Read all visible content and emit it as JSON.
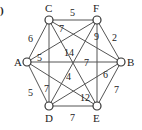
{
  "figure": {
    "corner_mark": ")",
    "nodes": [
      {
        "id": "C",
        "label": "C",
        "x": 49,
        "y": 20
      },
      {
        "id": "F",
        "label": "F",
        "x": 97,
        "y": 20
      },
      {
        "id": "A",
        "label": "A",
        "x": 27,
        "y": 62
      },
      {
        "id": "B",
        "label": "B",
        "x": 121,
        "y": 62
      },
      {
        "id": "D",
        "label": "D",
        "x": 49,
        "y": 106
      },
      {
        "id": "E",
        "label": "E",
        "x": 97,
        "y": 106
      }
    ],
    "edges": [
      {
        "from": "C",
        "to": "F",
        "weight": "5"
      },
      {
        "from": "C",
        "to": "A",
        "weight": "6"
      },
      {
        "from": "C",
        "to": "B",
        "weight": "7"
      },
      {
        "from": "C",
        "to": "D",
        "weight": "7"
      },
      {
        "from": "C",
        "to": "E",
        "weight": "14"
      },
      {
        "from": "F",
        "to": "B",
        "weight": "2"
      },
      {
        "from": "F",
        "to": "A",
        "weight": "5"
      },
      {
        "from": "F",
        "to": "E",
        "weight": "9"
      },
      {
        "from": "F",
        "to": "D",
        "weight": "4"
      },
      {
        "from": "A",
        "to": "B",
        "weight": "7"
      },
      {
        "from": "A",
        "to": "D",
        "weight": "5"
      },
      {
        "from": "A",
        "to": "E",
        "weight": "12"
      },
      {
        "from": "B",
        "to": "E",
        "weight": "7"
      },
      {
        "from": "B",
        "to": "D",
        "weight": "6"
      },
      {
        "from": "D",
        "to": "E",
        "weight": "7"
      }
    ]
  }
}
